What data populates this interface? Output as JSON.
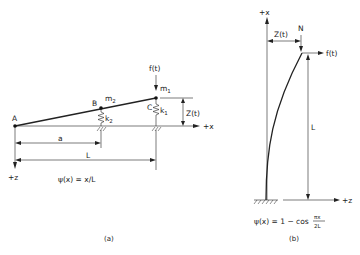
{
  "panel_a": {
    "points": {
      "A": "A",
      "B": "B",
      "C": "C"
    },
    "masses": {
      "m2": "m",
      "m2_sub": "2",
      "m1": "m",
      "m1_sub": "1"
    },
    "springs": {
      "k2": "k",
      "k2_sub": "2",
      "k1": "k",
      "k1_sub": "1"
    },
    "force_label": "f(t)",
    "displacement_label": "Z(t)",
    "axis_x_label": "+x",
    "axis_z_label": "+z",
    "dim_a_label": "a",
    "dim_L_label": "L",
    "shape_function": "ψ(x) = x/L",
    "caption": "(a)"
  },
  "panel_b": {
    "axis_x_label": "+x",
    "axis_z_label": "+z",
    "axial_load_label": "N",
    "force_label": "f(t)",
    "displacement_label": "Z(t)",
    "dim_L_label": "L",
    "shape_function_prefix": "ψ(x) = 1 − cos",
    "shape_function_num": "πx",
    "shape_function_den": "2L",
    "caption": "(b)"
  }
}
